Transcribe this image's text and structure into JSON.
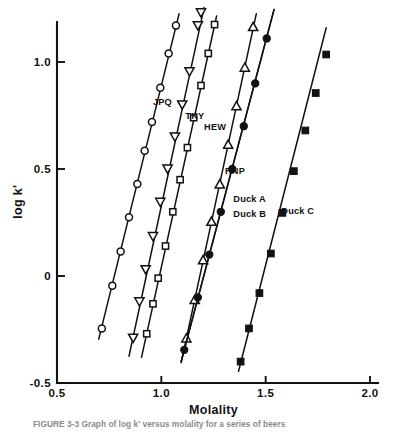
{
  "figure": {
    "caption_partial": "FIGURE 3-3   Graph of log k' versus molality for a series of beers",
    "background_color": "#ffffff",
    "ink_color": "#111111"
  },
  "chart_data": {
    "type": "scatter",
    "title": "",
    "subtitle": "",
    "xlabel": "Molality",
    "ylabel": "log k'",
    "xlim": [
      0.5,
      2.0
    ],
    "ylim": [
      -0.5,
      1.25
    ],
    "grid": false,
    "legend_position": "inline-annotations",
    "xticks": [
      0.5,
      1.0,
      1.5,
      2.0
    ],
    "xtick_labels": [
      "0.5",
      "1.0",
      "1.5",
      "2.0"
    ],
    "yticks": [
      1.0,
      0.5,
      0,
      -0.5
    ],
    "ytick_labels": [
      "1.0",
      "0.5",
      "0",
      "-0.5"
    ],
    "series": [
      {
        "name": "JPQ",
        "marker": "open-circle",
        "label": "JPQ",
        "label_x": 0.96,
        "label_y": 0.8,
        "line_x": [
          0.7,
          1.085
        ],
        "line_y": [
          -0.295,
          1.225
        ],
        "points": [
          {
            "x": 0.715,
            "y": -0.245
          },
          {
            "x": 0.765,
            "y": -0.045
          },
          {
            "x": 0.805,
            "y": 0.115
          },
          {
            "x": 0.845,
            "y": 0.275
          },
          {
            "x": 0.885,
            "y": 0.43
          },
          {
            "x": 0.92,
            "y": 0.585
          },
          {
            "x": 0.955,
            "y": 0.72
          },
          {
            "x": 0.995,
            "y": 0.88
          },
          {
            "x": 1.035,
            "y": 1.04
          },
          {
            "x": 1.07,
            "y": 1.17
          }
        ]
      },
      {
        "name": "TKY",
        "marker": "open-down-triangle",
        "label": "TKY",
        "label_x": 1.115,
        "label_y": 0.735,
        "line_x": [
          0.845,
          1.205
        ],
        "line_y": [
          -0.375,
          1.255
        ],
        "points": [
          {
            "x": 0.865,
            "y": -0.29
          },
          {
            "x": 0.895,
            "y": -0.12
          },
          {
            "x": 0.925,
            "y": 0.03
          },
          {
            "x": 0.96,
            "y": 0.185
          },
          {
            "x": 0.995,
            "y": 0.345
          },
          {
            "x": 1.03,
            "y": 0.5
          },
          {
            "x": 1.065,
            "y": 0.65
          },
          {
            "x": 1.1,
            "y": 0.8
          },
          {
            "x": 1.135,
            "y": 0.955
          },
          {
            "x": 1.175,
            "y": 1.17
          },
          {
            "x": 1.19,
            "y": 1.23
          }
        ]
      },
      {
        "name": "HEW",
        "marker": "open-square",
        "label": "HEW",
        "label_x": 1.205,
        "label_y": 0.68,
        "line_x": [
          0.905,
          1.265
        ],
        "line_y": [
          -0.38,
          1.215
        ],
        "points": [
          {
            "x": 0.93,
            "y": -0.27
          },
          {
            "x": 0.96,
            "y": -0.13
          },
          {
            "x": 0.985,
            "y": -0.01
          },
          {
            "x": 1.02,
            "y": 0.14
          },
          {
            "x": 1.055,
            "y": 0.3
          },
          {
            "x": 1.09,
            "y": 0.45
          },
          {
            "x": 1.125,
            "y": 0.6
          },
          {
            "x": 1.155,
            "y": 0.74
          },
          {
            "x": 1.19,
            "y": 0.89
          },
          {
            "x": 1.225,
            "y": 1.04
          },
          {
            "x": 1.255,
            "y": 1.175
          }
        ]
      },
      {
        "name": "RNP",
        "marker": "open-up-triangle",
        "label": "RNP",
        "label_x": 1.305,
        "label_y": 0.475,
        "line_x": [
          1.095,
          1.455
        ],
        "line_y": [
          -0.405,
          1.225
        ],
        "points": [
          {
            "x": 1.12,
            "y": -0.29
          },
          {
            "x": 1.16,
            "y": -0.11
          },
          {
            "x": 1.2,
            "y": 0.075
          },
          {
            "x": 1.24,
            "y": 0.255
          },
          {
            "x": 1.28,
            "y": 0.43
          },
          {
            "x": 1.32,
            "y": 0.615
          },
          {
            "x": 1.36,
            "y": 0.795
          },
          {
            "x": 1.4,
            "y": 0.975
          },
          {
            "x": 1.44,
            "y": 1.165
          }
        ]
      },
      {
        "name": "Duck A",
        "marker": "filled-circle",
        "label": "Duck A",
        "label_x": 1.345,
        "label_y": 0.345,
        "line_x": [
          1.095,
          1.54
        ],
        "line_y": [
          -0.4,
          1.245
        ],
        "points": [
          {
            "x": 1.11,
            "y": -0.345
          },
          {
            "x": 1.175,
            "y": -0.1
          },
          {
            "x": 1.23,
            "y": 0.1
          },
          {
            "x": 1.285,
            "y": 0.3
          },
          {
            "x": 1.34,
            "y": 0.5
          },
          {
            "x": 1.395,
            "y": 0.7
          },
          {
            "x": 1.45,
            "y": 0.9
          },
          {
            "x": 1.505,
            "y": 1.11
          }
        ]
      },
      {
        "name": "Duck B",
        "marker": "filled-circle",
        "label": "Duck B",
        "label_x": 1.345,
        "label_y": 0.275,
        "line_x": [
          1.095,
          1.54
        ],
        "line_y": [
          -0.4,
          1.245
        ],
        "points": []
      },
      {
        "name": "Duck C",
        "marker": "filled-square",
        "label": "Duck C",
        "label_x": 1.575,
        "label_y": 0.29,
        "line_x": [
          1.37,
          1.79
        ],
        "line_y": [
          -0.445,
          1.16
        ],
        "points": [
          {
            "x": 1.38,
            "y": -0.4
          },
          {
            "x": 1.42,
            "y": -0.245
          },
          {
            "x": 1.47,
            "y": -0.08
          },
          {
            "x": 1.525,
            "y": 0.105
          },
          {
            "x": 1.58,
            "y": 0.295
          },
          {
            "x": 1.635,
            "y": 0.49
          },
          {
            "x": 1.69,
            "y": 0.68
          },
          {
            "x": 1.74,
            "y": 0.855
          },
          {
            "x": 1.79,
            "y": 1.035
          }
        ]
      }
    ]
  }
}
